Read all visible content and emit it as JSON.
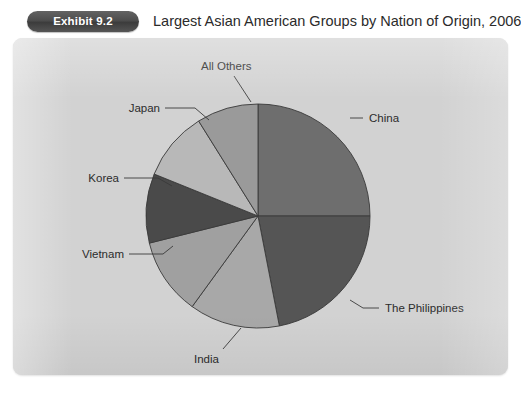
{
  "header": {
    "exhibit_badge": "Exhibit 9.2",
    "title": "Largest Asian American Groups by Nation of Origin, 2006"
  },
  "colors": {
    "page_background": "#ffffff",
    "panel_background": "#d2d2d2",
    "badge_background": "#4d4d4d",
    "badge_text": "#ffffff",
    "title_text": "#2b2b2b",
    "label_text": "#2c2c2c",
    "slice_outline": "#3a3a3a"
  },
  "chart_data": {
    "type": "pie",
    "title": "Largest Asian American Groups by Nation of Origin, 2006",
    "subtitle": "",
    "xlabel": "",
    "ylabel": "",
    "legend_position": "none",
    "labels_position": "outside-with-leader-lines",
    "grid": false,
    "start_angle_deg": 0,
    "direction": "clockwise",
    "categories": [
      "China",
      "The Philippines",
      "India",
      "Vietnam",
      "Korea",
      "Japan",
      "All Others"
    ],
    "values": [
      25,
      22,
      13,
      11,
      10,
      10,
      9
    ],
    "slices": [
      {
        "label": "China",
        "value": 25,
        "color": "#6e6e6e",
        "start_deg": 0,
        "end_deg": 90
      },
      {
        "label": "The Philippines",
        "value": 22,
        "color": "#555555",
        "start_deg": 90,
        "end_deg": 169
      },
      {
        "label": "India",
        "value": 13,
        "color": "#a8a8a8",
        "start_deg": 169,
        "end_deg": 216
      },
      {
        "label": "Vietnam",
        "value": 11,
        "color": "#a0a0a0",
        "start_deg": 216,
        "end_deg": 256
      },
      {
        "label": "Korea",
        "value": 10,
        "color": "#4a4a4a",
        "start_deg": 256,
        "end_deg": 292
      },
      {
        "label": "Japan",
        "value": 10,
        "color": "#b8b8b8",
        "start_deg": 292,
        "end_deg": 328
      },
      {
        "label": "All Others",
        "value": 9,
        "color": "#9a9a9a",
        "start_deg": 328,
        "end_deg": 360
      }
    ]
  },
  "labels": {
    "all_others": "All Others",
    "japan": "Japan",
    "korea": "Korea",
    "vietnam": "Vietnam",
    "india": "India",
    "china": "China",
    "philippines": "The Philippines"
  }
}
